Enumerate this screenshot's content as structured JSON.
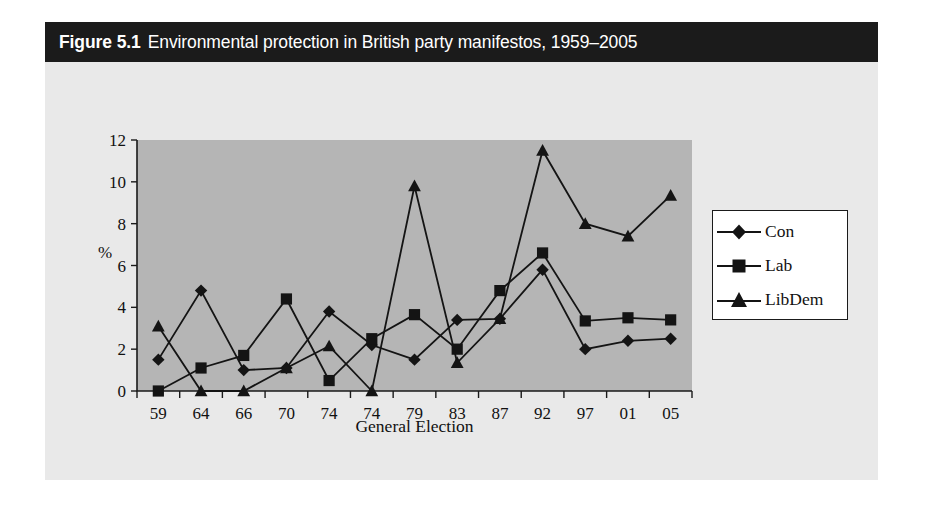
{
  "figure": {
    "number": "Figure 5.1",
    "title": "Environmental protection in British party manifestos, 1959–2005"
  },
  "chart_data": {
    "type": "line",
    "title": "Environmental protection in British party manifestos, 1959–2005",
    "xlabel": "General Election",
    "ylabel": "%",
    "categories": [
      "59",
      "64",
      "66",
      "70",
      "74",
      "74",
      "79",
      "83",
      "87",
      "92",
      "97",
      "01",
      "05"
    ],
    "ylim": [
      0,
      12
    ],
    "yticks": [
      0,
      2,
      4,
      6,
      8,
      10,
      12
    ],
    "grid": false,
    "legend_position": "right-outside",
    "series": [
      {
        "name": "Con",
        "marker": "diamond",
        "values": [
          1.5,
          4.8,
          1.0,
          1.1,
          3.8,
          2.2,
          1.5,
          3.4,
          3.45,
          5.8,
          2.0,
          2.4,
          2.5
        ]
      },
      {
        "name": "Lab",
        "marker": "square",
        "values": [
          0.0,
          1.1,
          1.7,
          4.4,
          0.5,
          2.5,
          3.65,
          2.0,
          4.8,
          6.6,
          3.35,
          3.5,
          3.4
        ]
      },
      {
        "name": "LibDem",
        "marker": "triangle",
        "values": [
          3.1,
          0.0,
          0.0,
          1.1,
          2.15,
          0.0,
          9.8,
          1.35,
          3.45,
          11.5,
          8.0,
          7.4,
          9.35
        ]
      }
    ]
  },
  "legend": {
    "entries": [
      {
        "label": "Con"
      },
      {
        "label": "Lab"
      },
      {
        "label": "LibDem"
      }
    ]
  },
  "colors": {
    "title_bar_bg": "#1b1b1b",
    "title_text": "#ffffff",
    "figure_bg": "#e9e9e9",
    "plot_bg": "#b5b5b5",
    "ink": "#141414"
  }
}
